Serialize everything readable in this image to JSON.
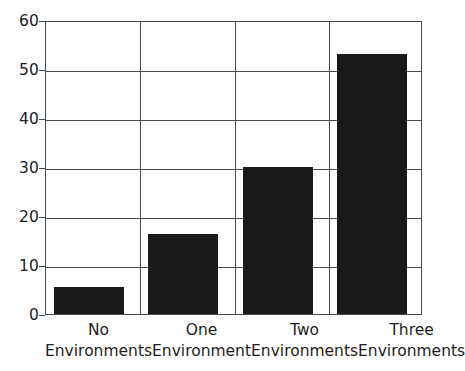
{
  "chart_data": {
    "type": "bar",
    "title": "",
    "subtitle": "",
    "xlabel": "",
    "ylabel": "",
    "categories": [
      "No Environments",
      "One Environment",
      "Two Environments",
      "Three Environments"
    ],
    "category_lines": [
      [
        "No",
        "Environments"
      ],
      [
        "One",
        "Environment"
      ],
      [
        "Two",
        "Environments"
      ],
      [
        "Three",
        "Environments"
      ]
    ],
    "values": [
      5.5,
      16.4,
      30,
      53
    ],
    "ylim": [
      0,
      60
    ],
    "yticks": [
      0,
      10,
      20,
      30,
      40,
      50,
      60
    ],
    "ytick_labels": [
      "0",
      "10",
      "20",
      "30",
      "40",
      "50",
      "60"
    ],
    "grid": "horizontal-and-vertical",
    "legend": "none",
    "bar_color": "#1a1a1a",
    "axis_color": "#4a4a4a",
    "background_color": "#ffffff"
  }
}
